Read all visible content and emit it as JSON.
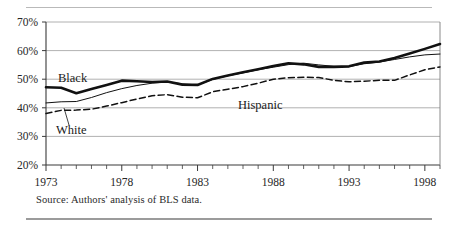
{
  "figure": {
    "source_note": "Source: Authors' analysis of BLS data.",
    "label_black": "Black",
    "label_white": "White",
    "label_hispanic": "Hispanic"
  },
  "chart_data": {
    "type": "line",
    "title": "",
    "xlabel": "",
    "ylabel": "",
    "xlim": [
      1973,
      1999
    ],
    "ylim": [
      20,
      70
    ],
    "ytick_values": [
      20,
      30,
      40,
      50,
      60,
      70
    ],
    "ytick_labels": [
      "20%",
      "30%",
      "40%",
      "50%",
      "60%",
      "70%"
    ],
    "xtick_values": [
      1973,
      1978,
      1983,
      1988,
      1993,
      1998
    ],
    "xtick_labels": [
      "1973",
      "1978",
      "1983",
      "1988",
      "1993",
      "1998"
    ],
    "minor_xticks_every": 1,
    "grid": "horizontal",
    "legend": "inline-annotations",
    "x": [
      1973,
      1974,
      1975,
      1976,
      1977,
      1978,
      1979,
      1980,
      1981,
      1982,
      1983,
      1984,
      1985,
      1986,
      1987,
      1988,
      1989,
      1990,
      1991,
      1992,
      1993,
      1994,
      1995,
      1996,
      1997,
      1998,
      1999
    ],
    "series": [
      {
        "name": "Black",
        "style": "thick-solid",
        "color": "#111111",
        "values": [
          47.2,
          47.0,
          45.1,
          46.6,
          48.0,
          49.5,
          49.3,
          49.0,
          49.2,
          48.1,
          48.0,
          50.1,
          51.3,
          52.4,
          53.5,
          54.6,
          55.6,
          55.2,
          54.3,
          54.3,
          54.5,
          55.8,
          56.2,
          57.4,
          59.0,
          60.6,
          62.3
        ]
      },
      {
        "name": "White",
        "style": "thin-solid",
        "color": "#111111",
        "values": [
          41.7,
          42.1,
          42.2,
          43.6,
          45.3,
          46.7,
          47.8,
          48.6,
          49.0,
          48.4,
          48.0,
          49.9,
          51.2,
          52.2,
          53.3,
          54.2,
          55.1,
          55.6,
          55.0,
          54.5,
          54.4,
          55.4,
          56.0,
          56.9,
          57.8,
          58.5,
          58.8
        ]
      },
      {
        "name": "Hispanic",
        "style": "dashed",
        "color": "#111111",
        "values": [
          38.0,
          39.1,
          39.2,
          39.5,
          40.6,
          41.8,
          43.1,
          44.2,
          44.6,
          43.7,
          43.5,
          45.6,
          46.5,
          47.4,
          48.6,
          50.0,
          50.5,
          50.7,
          50.6,
          49.6,
          49.1,
          49.3,
          49.6,
          49.6,
          51.5,
          53.3,
          54.3
        ]
      }
    ]
  }
}
